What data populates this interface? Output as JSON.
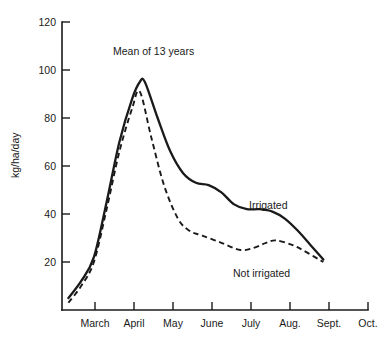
{
  "chart_data": {
    "type": "line",
    "title": "",
    "annotation": "Mean of 13 years",
    "xlabel": "",
    "ylabel": "kg/ha/day",
    "ylim": [
      0,
      120
    ],
    "yticks": [
      20,
      40,
      60,
      80,
      100,
      120
    ],
    "ytick_labels": [
      "20",
      "40",
      "60",
      "80",
      "100",
      "120"
    ],
    "categories": [
      "March",
      "April",
      "May",
      "June",
      "July",
      "Aug.",
      "Sept.",
      "Oct."
    ],
    "xtick_labels": [
      "March",
      "April",
      "May",
      "June",
      "July",
      "Aug.",
      "Sept.",
      "Oct."
    ],
    "grid": false,
    "legend_position": "inline-annotation",
    "series": [
      {
        "name": "Irrigated",
        "style": "solid",
        "color": "#1a1a1a",
        "points": [
          {
            "x": "Mar 5",
            "y": 5
          },
          {
            "x": "Mar 15",
            "y": 12
          },
          {
            "x": "Mar 25",
            "y": 22
          },
          {
            "x": "Apr 5",
            "y": 45
          },
          {
            "x": "Apr 15",
            "y": 70
          },
          {
            "x": "Apr 25",
            "y": 88
          },
          {
            "x": "May 1",
            "y": 95
          },
          {
            "x": "May 5",
            "y": 95
          },
          {
            "x": "May 15",
            "y": 80
          },
          {
            "x": "May 25",
            "y": 66
          },
          {
            "x": "Jun 5",
            "y": 57
          },
          {
            "x": "Jun 15",
            "y": 53
          },
          {
            "x": "Jun 25",
            "y": 52
          },
          {
            "x": "Jul 5",
            "y": 49
          },
          {
            "x": "Jul 15",
            "y": 44
          },
          {
            "x": "Jul 25",
            "y": 42
          },
          {
            "x": "Aug 5",
            "y": 42
          },
          {
            "x": "Aug 15",
            "y": 41
          },
          {
            "x": "Aug 25",
            "y": 38
          },
          {
            "x": "Sep 5",
            "y": 33
          },
          {
            "x": "Sep 15",
            "y": 27
          },
          {
            "x": "Sep 25",
            "y": 21
          }
        ]
      },
      {
        "name": "Not irrigated",
        "style": "dashed",
        "color": "#1a1a1a",
        "points": [
          {
            "x": "Mar 5",
            "y": 3
          },
          {
            "x": "Mar 15",
            "y": 10
          },
          {
            "x": "Mar 25",
            "y": 20
          },
          {
            "x": "Apr 5",
            "y": 42
          },
          {
            "x": "Apr 15",
            "y": 66
          },
          {
            "x": "Apr 25",
            "y": 84
          },
          {
            "x": "May 1",
            "y": 91
          },
          {
            "x": "May 10",
            "y": 72
          },
          {
            "x": "May 20",
            "y": 52
          },
          {
            "x": "Jun 1",
            "y": 38
          },
          {
            "x": "Jun 10",
            "y": 33
          },
          {
            "x": "Jun 20",
            "y": 31
          },
          {
            "x": "Jul 5",
            "y": 28
          },
          {
            "x": "Jul 20",
            "y": 25
          },
          {
            "x": "Aug 1",
            "y": 26
          },
          {
            "x": "Aug 10",
            "y": 28
          },
          {
            "x": "Aug 18",
            "y": 29
          },
          {
            "x": "Sep 1",
            "y": 27
          },
          {
            "x": "Sep 12",
            "y": 24
          },
          {
            "x": "Sep 25",
            "y": 20
          }
        ]
      }
    ]
  },
  "labels": {
    "irrigated": "Irrigated",
    "not_irrigated": "Not irrigated"
  }
}
